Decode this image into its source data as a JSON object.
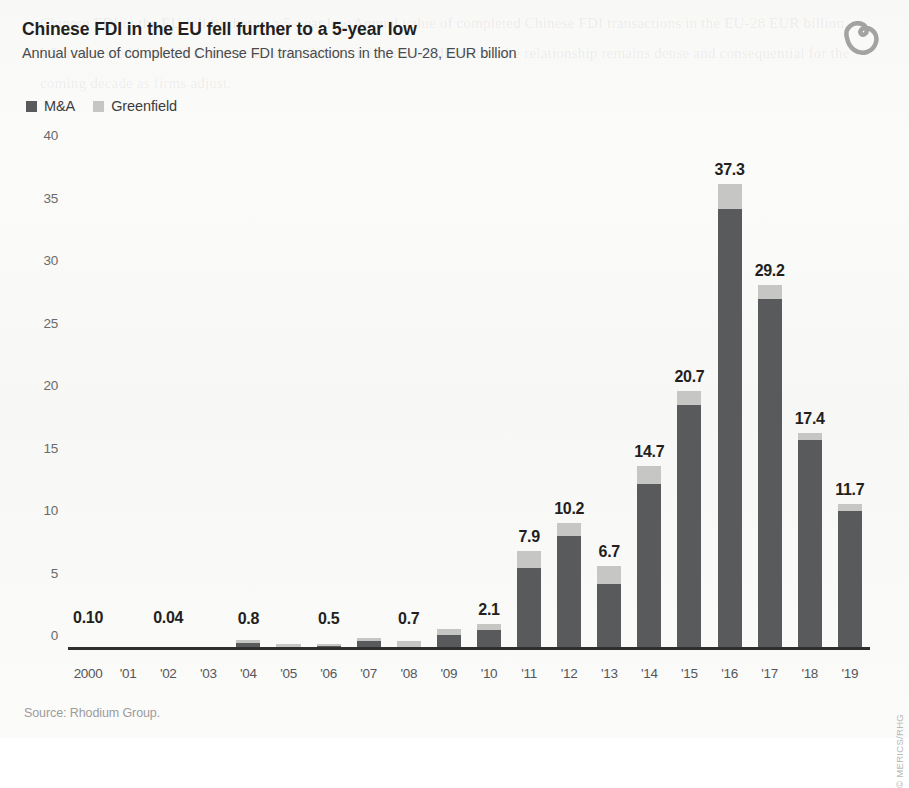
{
  "header": {
    "title": "Chinese FDI in the EU fell further to a 5-year low",
    "subtitle": "Annual value of completed Chinese FDI transactions in the EU-28, EUR billion",
    "logo_name": "merics-logo"
  },
  "legend": {
    "items": [
      {
        "label": "M&A",
        "color": "#595a5c"
      },
      {
        "label": "Greenfield",
        "color": "#c6c7c5"
      }
    ]
  },
  "footer": {
    "source": "Source: Rhodium Group.",
    "credit": "© MERICS/RHG"
  },
  "colors": {
    "ma": "#595a5c",
    "greenfield": "#c6c7c5",
    "axis": "#2f2f2f",
    "background": "#fbfbfa",
    "label_text": "#231f20"
  },
  "ghost_text": "Chinese FDI in the EU fell further to a 5-year low Annual value of completed Chinese FDI transactions in the EU-28 EUR billion With sustained levels of commercial and policy activity in both directions the relationship remains dense and consequential for the coming decade as firms adjust.",
  "chart_data": {
    "type": "bar",
    "stacked": true,
    "title": "Chinese FDI in the EU fell further to a 5-year low",
    "subtitle": "Annual value of completed Chinese FDI transactions in the EU-28, EUR billion",
    "xlabel": "",
    "ylabel": "EUR billion",
    "ylim": [
      0,
      40
    ],
    "yticks": [
      0,
      5,
      10,
      15,
      20,
      25,
      30,
      35,
      40
    ],
    "grid": false,
    "legend_position": "top-left",
    "categories": [
      "2000",
      "'01",
      "'02",
      "'03",
      "'04",
      "'05",
      "'06",
      "'07",
      "'08",
      "'09",
      "'10",
      "'11",
      "'12",
      "'13",
      "'14",
      "'15",
      "'16",
      "'17",
      "'18",
      "'19"
    ],
    "series": [
      {
        "name": "M&A",
        "color": "#595a5c",
        "values": [
          0.05,
          0.05,
          0.02,
          0.1,
          0.55,
          0.25,
          0.3,
          0.7,
          0.25,
          1.2,
          1.6,
          6.6,
          9.1,
          5.3,
          13.3,
          19.6,
          35.3,
          28.1,
          16.8,
          11.1
        ]
      },
      {
        "name": "Greenfield",
        "color": "#c6c7c5",
        "values": [
          0.05,
          0.05,
          0.02,
          0.1,
          0.25,
          0.2,
          0.2,
          0.3,
          0.45,
          0.45,
          0.5,
          1.3,
          1.1,
          1.4,
          1.4,
          1.1,
          2.0,
          1.1,
          0.6,
          0.6
        ]
      }
    ],
    "totals": [
      0.1,
      0.1,
      0.04,
      0.2,
      0.8,
      0.45,
      0.5,
      1.0,
      0.7,
      1.65,
      2.1,
      7.9,
      10.2,
      6.7,
      14.7,
      20.7,
      37.3,
      29.2,
      17.4,
      11.7
    ],
    "point_labels": [
      "0.10",
      "",
      "0.04",
      "",
      "0.8",
      "",
      "0.5",
      "",
      "0.7",
      "",
      "2.1",
      "7.9",
      "10.2",
      "6.7",
      "14.7",
      "20.7",
      "37.3",
      "29.2",
      "17.4",
      "11.7"
    ],
    "label_min_offset": [
      "0.10",
      "0.04",
      "0.8",
      "0.5",
      "0.7"
    ]
  }
}
